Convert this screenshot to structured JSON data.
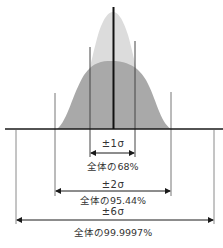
{
  "diagram": {
    "type": "normal-distribution-sigma-ranges",
    "colors": {
      "wide_curve_fill": "#a9a9a9",
      "narrow_curve_fill": "#dcdcdc",
      "axis": "#1a1a1a",
      "center_line": "#111111",
      "guide_lines": "#555555",
      "outer_guide_lines": "#8a8a8a",
      "text": "#333333"
    },
    "ranges": [
      {
        "id": "1sigma",
        "label": "±1σ",
        "caption": "全体の68%"
      },
      {
        "id": "2sigma",
        "label": "±2σ",
        "caption": "全体の95.44%"
      },
      {
        "id": "6sigma",
        "label": "±6σ",
        "caption": "全体の99.9997%"
      }
    ]
  }
}
